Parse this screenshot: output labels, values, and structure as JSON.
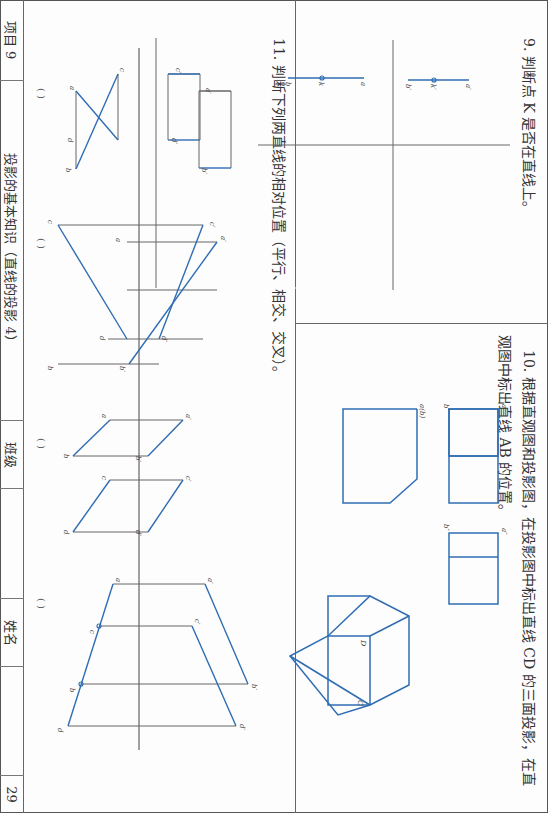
{
  "footer": {
    "project": "项目 9",
    "topic": "投影的基本知识（直线的投影 4）",
    "class_label": "班级",
    "class_value": "",
    "name_label": "姓名",
    "name_value": "",
    "page_number": "29"
  },
  "q9": {
    "title": "9. 判断点 K 是否在直线上。",
    "labels": {
      "front": [
        "a′",
        "k′",
        "b′"
      ],
      "top": [
        "a",
        "k",
        "b"
      ]
    }
  },
  "q10": {
    "title_line1": "10. 根据直观图和投影图，在投影图中标出直线 CD 的三面投影，在直",
    "title_line2": "观图中标出直线 AB 的位置。",
    "labels": {
      "front": [
        "a′",
        "b′"
      ],
      "side": [
        "a″",
        "b″"
      ],
      "top": "a(b)",
      "pictorial": [
        "D",
        "C"
      ]
    }
  },
  "q11": {
    "title": "11. 判断下列两直线的相对位置（平行、相交、交叉）。",
    "answers": [
      "(      )",
      "(      )",
      "(      )",
      "(      )"
    ],
    "figures": [
      {
        "labels": [
          "c′",
          "a′",
          "d′",
          "b′",
          "c",
          "a",
          "d",
          "b"
        ]
      },
      {
        "labels": [
          "c′",
          "a′",
          "d′",
          "b′",
          "c",
          "a",
          "d",
          "b"
        ]
      },
      {
        "labels": [
          "a′",
          "b′",
          "c′",
          "d′",
          "a",
          "b",
          "c",
          "d"
        ]
      },
      {
        "labels": [
          "a′",
          "c′",
          "b′",
          "d′",
          "a",
          "c",
          "b",
          "d"
        ]
      }
    ]
  },
  "colors": {
    "line_blue": "#2f6db3",
    "thin_gray": "#666666"
  }
}
